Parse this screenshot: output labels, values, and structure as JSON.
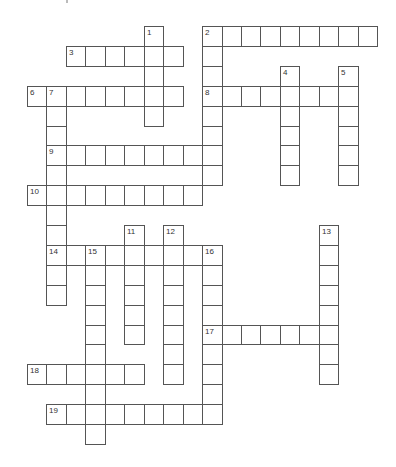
{
  "puzzle": {
    "type": "crossword",
    "layout": {
      "origin_x": 27,
      "origin_y": 26,
      "cell_w": 19.45,
      "cell_h": 19.9
    },
    "colors": {
      "border": "#555555",
      "cell": "#ffffff",
      "number": "#333333"
    },
    "words": [
      {
        "number": "1",
        "direction": "down",
        "row": 0,
        "col": 6,
        "length": 5
      },
      {
        "number": "2",
        "direction": "across",
        "row": 0,
        "col": 9,
        "length": 9
      },
      {
        "number": "2",
        "direction": "down",
        "row": 0,
        "col": 9,
        "length": 8
      },
      {
        "number": "3",
        "direction": "across",
        "row": 1,
        "col": 2,
        "length": 6
      },
      {
        "number": "4",
        "direction": "down",
        "row": 2,
        "col": 13,
        "length": 6
      },
      {
        "number": "5",
        "direction": "down",
        "row": 2,
        "col": 16,
        "length": 6
      },
      {
        "number": "6",
        "direction": "across",
        "row": 3,
        "col": 0,
        "length": 8
      },
      {
        "number": "7",
        "direction": "down",
        "row": 3,
        "col": 1,
        "length": 11
      },
      {
        "number": "8",
        "direction": "across",
        "row": 3,
        "col": 9,
        "length": 8
      },
      {
        "number": "9",
        "direction": "across",
        "row": 6,
        "col": 1,
        "length": 9
      },
      {
        "number": "10",
        "direction": "across",
        "row": 8,
        "col": 0,
        "length": 9
      },
      {
        "number": "11",
        "direction": "down",
        "row": 10,
        "col": 5,
        "length": 6
      },
      {
        "number": "12",
        "direction": "down",
        "row": 10,
        "col": 7,
        "length": 8
      },
      {
        "number": "13",
        "direction": "down",
        "row": 10,
        "col": 15,
        "length": 8
      },
      {
        "number": "14",
        "direction": "across",
        "row": 11,
        "col": 1,
        "length": 9
      },
      {
        "number": "15",
        "direction": "down",
        "row": 11,
        "col": 3,
        "length": 10
      },
      {
        "number": "16",
        "direction": "down",
        "row": 11,
        "col": 9,
        "length": 9
      },
      {
        "number": "17",
        "direction": "across",
        "row": 15,
        "col": 9,
        "length": 7
      },
      {
        "number": "18",
        "direction": "across",
        "row": 17,
        "col": 0,
        "length": 6
      },
      {
        "number": "19",
        "direction": "across",
        "row": 19,
        "col": 1,
        "length": 8
      }
    ]
  }
}
